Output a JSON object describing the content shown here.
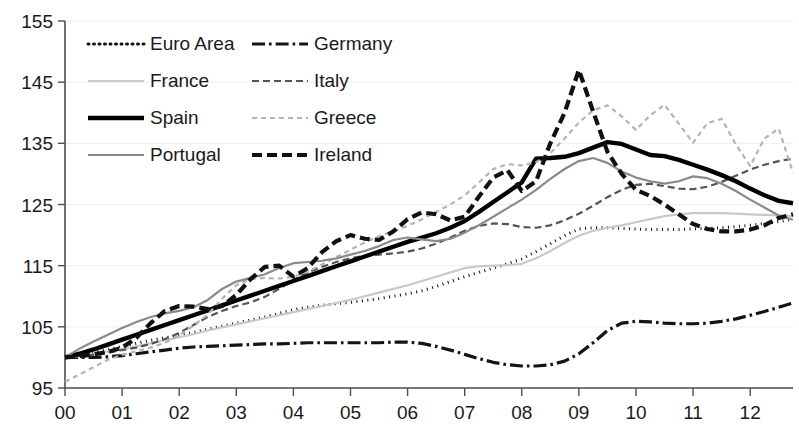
{
  "chart_data": {
    "type": "line",
    "title": "",
    "subtitle": "",
    "xlabel": "",
    "ylabel": "",
    "xlim": [
      2000.0,
      2012.75
    ],
    "ylim": [
      95,
      155
    ],
    "grid": true,
    "legend_position": "top-left",
    "x_tick_labels": [
      "00",
      "01",
      "02",
      "03",
      "04",
      "05",
      "06",
      "07",
      "08",
      "09",
      "10",
      "11",
      "12"
    ],
    "x_tick_values": [
      2000,
      2001,
      2002,
      2003,
      2004,
      2005,
      2006,
      2007,
      2008,
      2009,
      2010,
      2011,
      2012
    ],
    "y_tick_labels": [
      "95",
      "105",
      "115",
      "125",
      "135",
      "145",
      "155"
    ],
    "y_tick_values": [
      95,
      105,
      115,
      125,
      135,
      145,
      155
    ],
    "x": [
      2000.0,
      2000.25,
      2000.5,
      2000.75,
      2001.0,
      2001.25,
      2001.5,
      2001.75,
      2002.0,
      2002.25,
      2002.5,
      2002.75,
      2003.0,
      2003.25,
      2003.5,
      2003.75,
      2004.0,
      2004.25,
      2004.5,
      2004.75,
      2005.0,
      2005.25,
      2005.5,
      2005.75,
      2006.0,
      2006.25,
      2006.5,
      2006.75,
      2007.0,
      2007.25,
      2007.5,
      2007.75,
      2008.0,
      2008.25,
      2008.5,
      2008.75,
      2009.0,
      2009.25,
      2009.5,
      2009.75,
      2010.0,
      2010.25,
      2010.5,
      2010.75,
      2011.0,
      2011.25,
      2011.5,
      2011.75,
      2012.0,
      2012.25,
      2012.5,
      2012.75
    ],
    "series": [
      {
        "name": "Euro Area",
        "style": "dotted",
        "color": "#111111",
        "width": 3.0,
        "dash": "1,4.5",
        "values": [
          100.0,
          100.3,
          100.8,
          101.3,
          101.8,
          102.3,
          102.8,
          103.2,
          103.6,
          104.1,
          104.6,
          105.1,
          105.6,
          106.1,
          106.6,
          107.2,
          107.8,
          108.2,
          108.5,
          108.8,
          109.0,
          109.3,
          109.6,
          110.0,
          110.4,
          110.9,
          111.6,
          112.4,
          113.2,
          113.9,
          114.6,
          115.3,
          116.1,
          117.3,
          118.6,
          119.9,
          121.0,
          121.2,
          121.2,
          121.1,
          121.0,
          120.9,
          120.9,
          120.9,
          121.0,
          121.1,
          121.2,
          121.4,
          121.6,
          121.9,
          122.2,
          122.6
        ]
      },
      {
        "name": "Germany",
        "style": "dash-dot",
        "color": "#141414",
        "width": 3.2,
        "dash": "13,4,2.6,4",
        "values": [
          100.0,
          100.0,
          100.0,
          100.1,
          100.3,
          100.6,
          100.9,
          101.2,
          101.5,
          101.7,
          101.8,
          101.9,
          102.0,
          102.1,
          102.2,
          102.2,
          102.3,
          102.4,
          102.4,
          102.4,
          102.4,
          102.4,
          102.4,
          102.5,
          102.5,
          102.3,
          101.8,
          101.2,
          100.5,
          99.8,
          99.2,
          98.8,
          98.6,
          98.6,
          98.8,
          99.4,
          100.6,
          102.4,
          104.4,
          105.6,
          105.9,
          105.8,
          105.6,
          105.5,
          105.5,
          105.6,
          105.9,
          106.3,
          106.9,
          107.5,
          108.2,
          108.9
        ]
      },
      {
        "name": "France",
        "style": "solid",
        "color": "#c9c9c9",
        "width": 2.2,
        "dash": "",
        "values": [
          100.0,
          100.2,
          100.6,
          101.0,
          101.4,
          101.8,
          102.3,
          102.8,
          103.3,
          103.8,
          104.4,
          104.9,
          105.4,
          105.9,
          106.4,
          106.9,
          107.4,
          107.9,
          108.4,
          108.9,
          109.4,
          110.0,
          110.6,
          111.2,
          111.8,
          112.5,
          113.2,
          113.9,
          114.6,
          114.9,
          115.0,
          115.1,
          115.3,
          116.2,
          117.4,
          118.7,
          119.9,
          120.7,
          121.2,
          121.6,
          122.1,
          122.6,
          123.1,
          123.4,
          123.6,
          123.6,
          123.6,
          123.5,
          123.4,
          123.3,
          123.2,
          123.1
        ]
      },
      {
        "name": "Italy",
        "style": "dashed-thin",
        "color": "#555555",
        "width": 2.2,
        "dash": "7,4",
        "values": [
          100.0,
          100.2,
          100.4,
          100.8,
          101.2,
          101.6,
          102.2,
          103.0,
          104.0,
          105.3,
          106.6,
          107.6,
          108.4,
          109.0,
          109.9,
          111.2,
          112.6,
          113.9,
          114.8,
          115.6,
          116.2,
          116.6,
          116.8,
          117.0,
          117.3,
          117.8,
          118.6,
          119.6,
          120.7,
          121.5,
          121.9,
          121.8,
          121.3,
          121.2,
          121.6,
          122.4,
          123.5,
          124.8,
          126.2,
          127.4,
          128.2,
          128.4,
          128.0,
          127.6,
          127.5,
          127.9,
          128.7,
          129.7,
          130.7,
          131.5,
          132.1,
          132.5
        ]
      },
      {
        "name": "Spain",
        "style": "solid-bold",
        "color": "#000000",
        "width": 4.4,
        "dash": "",
        "values": [
          100.0,
          100.6,
          101.3,
          102.1,
          102.9,
          103.7,
          104.5,
          105.3,
          106.1,
          106.9,
          107.7,
          108.5,
          109.3,
          110.1,
          110.9,
          111.7,
          112.5,
          113.3,
          114.1,
          114.9,
          115.7,
          116.5,
          117.3,
          118.1,
          118.9,
          119.6,
          120.3,
          121.2,
          122.3,
          123.8,
          125.4,
          127.0,
          128.6,
          132.5,
          132.6,
          132.8,
          133.4,
          134.3,
          135.2,
          134.9,
          134.0,
          133.1,
          132.9,
          132.3,
          131.5,
          130.7,
          129.8,
          128.8,
          127.6,
          126.5,
          125.6,
          125.2
        ]
      },
      {
        "name": "Greece",
        "style": "dotted-light",
        "color": "#b4b4b4",
        "width": 2.2,
        "dash": "5,4",
        "values": [
          96.0,
          97.2,
          98.4,
          99.6,
          100.4,
          101.0,
          101.6,
          102.4,
          103.6,
          105.2,
          107.0,
          109.6,
          111.8,
          112.8,
          113.0,
          112.9,
          113.2,
          114.0,
          115.2,
          116.4,
          117.6,
          118.8,
          119.8,
          120.6,
          121.5,
          122.6,
          123.8,
          125.0,
          126.5,
          128.6,
          130.8,
          131.6,
          131.4,
          131.9,
          133.4,
          135.8,
          138.4,
          140.4,
          141.2,
          139.4,
          137.2,
          139.6,
          141.3,
          138.2,
          135.1,
          138.3,
          139.0,
          134.8,
          131.3,
          135.8,
          137.4,
          130.2
        ]
      },
      {
        "name": "Portugal",
        "style": "solid-gray",
        "color": "#8a8a8a",
        "width": 2.2,
        "dash": "",
        "values": [
          100.0,
          101.4,
          102.6,
          103.7,
          104.8,
          105.8,
          106.6,
          107.2,
          107.6,
          108.2,
          109.4,
          111.2,
          112.4,
          113.0,
          113.6,
          114.6,
          115.4,
          115.6,
          115.8,
          116.2,
          116.8,
          117.4,
          118.2,
          119.2,
          119.6,
          119.3,
          119.0,
          119.4,
          120.4,
          121.6,
          123.0,
          124.4,
          125.8,
          127.4,
          129.2,
          130.8,
          132.1,
          132.6,
          131.8,
          130.4,
          129.4,
          128.8,
          128.4,
          128.8,
          129.6,
          129.3,
          128.4,
          127.2,
          125.8,
          124.5,
          123.2,
          122.5
        ]
      },
      {
        "name": "Ireland",
        "style": "dashed-bold",
        "color": "#111111",
        "width": 4.2,
        "dash": "10,5",
        "values": [
          100.0,
          100.2,
          100.5,
          100.9,
          101.6,
          103.2,
          105.6,
          107.6,
          108.4,
          108.3,
          107.9,
          108.4,
          110.2,
          112.8,
          114.8,
          115.0,
          113.2,
          114.6,
          117.2,
          119.0,
          120.0,
          119.4,
          119.2,
          120.6,
          122.6,
          123.7,
          123.4,
          122.4,
          123.0,
          126.3,
          129.4,
          130.6,
          127.2,
          128.8,
          135.0,
          140.0,
          147.0,
          140.2,
          133.6,
          130.0,
          127.4,
          126.4,
          125.0,
          123.4,
          121.8,
          121.0,
          120.6,
          120.6,
          120.9,
          121.6,
          122.8,
          123.4
        ]
      }
    ]
  },
  "legend": {
    "entries": [
      {
        "label": "Euro Area",
        "series": "Euro Area"
      },
      {
        "label": "Germany",
        "series": "Germany"
      },
      {
        "label": "France",
        "series": "France"
      },
      {
        "label": "Italy",
        "series": "Italy"
      },
      {
        "label": "Spain",
        "series": "Spain"
      },
      {
        "label": "Greece",
        "series": "Greece"
      },
      {
        "label": "Portugal",
        "series": "Portugal"
      },
      {
        "label": "Ireland",
        "series": "Ireland"
      }
    ]
  }
}
